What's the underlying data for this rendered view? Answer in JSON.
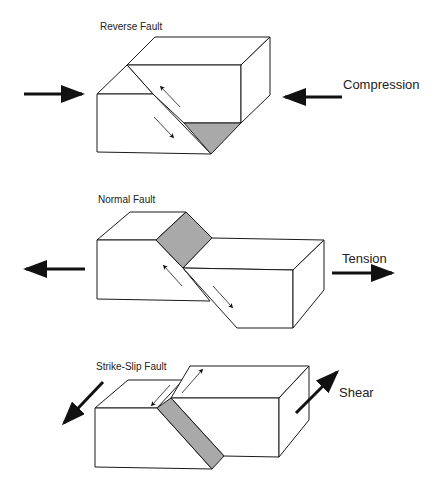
{
  "diagrams": [
    {
      "title": "Reverse Fault",
      "stress": "Compression"
    },
    {
      "title": "Normal Fault",
      "stress": "Tension"
    },
    {
      "title": "Strike-Slip Fault",
      "stress": "Shear"
    }
  ],
  "colors": {
    "line": "#1a1a1a",
    "fault_plane": "#a9a9a9",
    "background": "#ffffff"
  }
}
